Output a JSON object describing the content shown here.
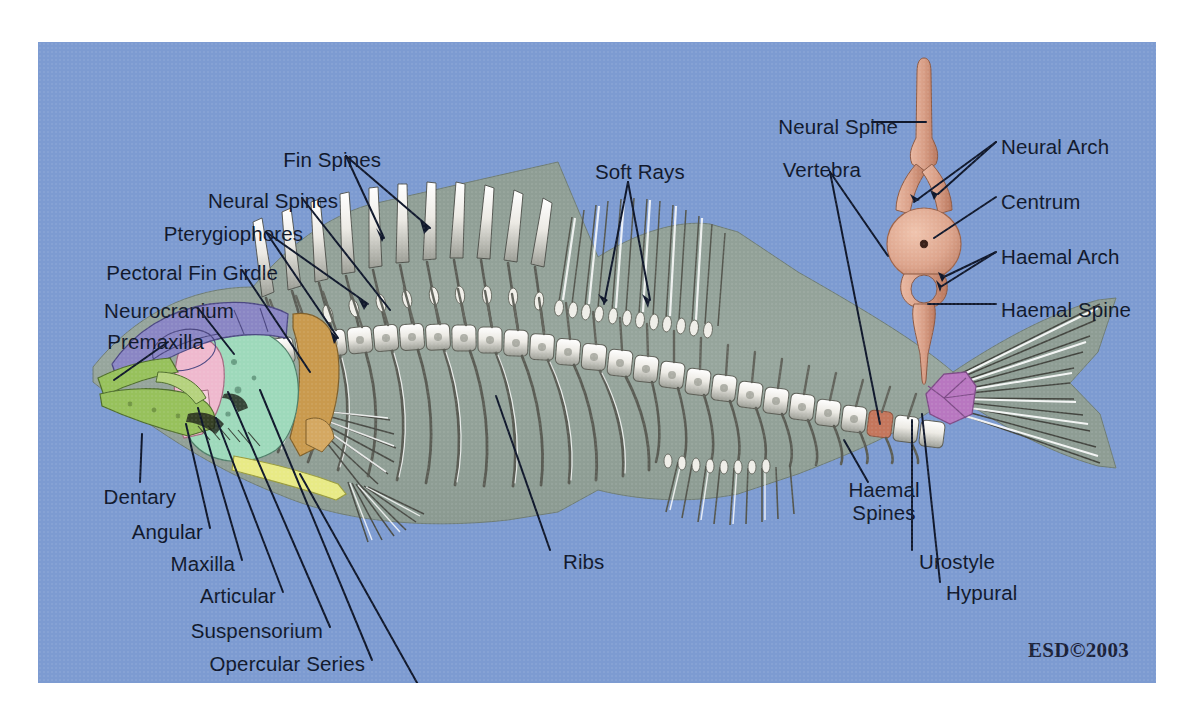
{
  "figure": {
    "background_color": "#7d9bd1",
    "text_color": "#10182c",
    "credit": "ESD©2003"
  },
  "labels": {
    "fish": [
      {
        "id": "fin-spines",
        "text": "Fin Spines",
        "x": 343,
        "y": 118,
        "align": "right"
      },
      {
        "id": "neural-spines",
        "text": "Neural Spines",
        "x": 300,
        "y": 159,
        "align": "right"
      },
      {
        "id": "pterygiophores",
        "text": "Pterygiophores",
        "x": 265,
        "y": 192,
        "align": "right"
      },
      {
        "id": "pectoral-fin-girdle",
        "text": "Pectoral Fin Girdle",
        "x": 240,
        "y": 231,
        "align": "right"
      },
      {
        "id": "neurocranium",
        "text": "Neurocranium",
        "x": 196,
        "y": 269,
        "align": "right"
      },
      {
        "id": "premaxilla",
        "text": "Premaxilla",
        "x": 166,
        "y": 300,
        "align": "right"
      },
      {
        "id": "dentary",
        "text": "Dentary",
        "x": 138,
        "y": 455,
        "align": "right"
      },
      {
        "id": "angular",
        "text": "Angular",
        "x": 165,
        "y": 490,
        "align": "right"
      },
      {
        "id": "maxilla",
        "text": "Maxilla",
        "x": 197,
        "y": 522,
        "align": "right"
      },
      {
        "id": "articular",
        "text": "Articular",
        "x": 238,
        "y": 554,
        "align": "right"
      },
      {
        "id": "suspensorium",
        "text": "Suspensorium",
        "x": 285,
        "y": 589,
        "align": "right"
      },
      {
        "id": "opercular-series",
        "text": "Opercular Series",
        "x": 327,
        "y": 622,
        "align": "right"
      },
      {
        "id": "pelvic-fin-girdle",
        "text": "Pelvic Fin Girdle",
        "x": 380,
        "y": 659,
        "align": "right"
      },
      {
        "id": "soft-rays",
        "text": "Soft Rays",
        "x": 557,
        "y": 130,
        "align": "left"
      },
      {
        "id": "ribs",
        "text": "Ribs",
        "x": 525,
        "y": 520,
        "align": "left"
      },
      {
        "id": "haemal-spines",
        "text": "Haemal\nSpines",
        "x": 846,
        "y": 460,
        "align": "center"
      },
      {
        "id": "urostyle",
        "text": "Urostyle",
        "x": 881,
        "y": 520,
        "align": "left"
      },
      {
        "id": "hypural",
        "text": "Hypural",
        "x": 908,
        "y": 551,
        "align": "left"
      }
    ],
    "vertebra_inset": [
      {
        "id": "neural-spine",
        "text": "Neural Spine",
        "x": 860,
        "y": 85,
        "align": "right"
      },
      {
        "id": "vertebra",
        "text": "Vertebra",
        "x": 823,
        "y": 128,
        "align": "right"
      },
      {
        "id": "neural-arch",
        "text": "Neural Arch",
        "x": 963,
        "y": 105,
        "align": "left"
      },
      {
        "id": "centrum",
        "text": "Centrum",
        "x": 963,
        "y": 160,
        "align": "left"
      },
      {
        "id": "haemal-arch",
        "text": "Haemal Arch",
        "x": 963,
        "y": 215,
        "align": "left"
      },
      {
        "id": "haemal-spine",
        "text": "Haemal Spine",
        "x": 963,
        "y": 268,
        "align": "left"
      }
    ]
  },
  "anatomy_colors": {
    "body_silhouette": "#93a29a",
    "bone_light": "#f2f2ee",
    "bone_shadow": "#7d7f78",
    "neurocranium": "#8a86c4",
    "premaxilla_dentary": "#97c15c",
    "suspensorium": "#efb9ce",
    "opercular_series": "#9ed9bb",
    "pectoral_girdle": "#c99a4e",
    "pelvic_girdle": "#e8ea86",
    "hypural": "#b877c0",
    "vertebra_highlight": "#c4765c",
    "inset_bone": "#d9a08c"
  }
}
